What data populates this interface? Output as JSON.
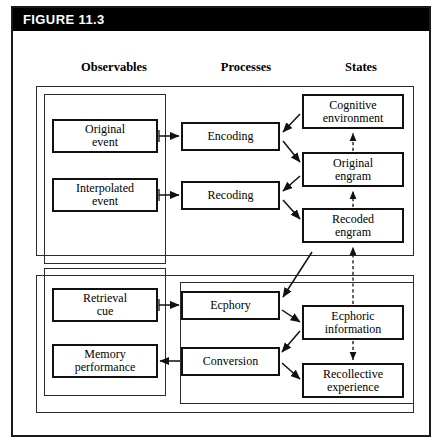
{
  "figure": {
    "header_label": "FIGURE 11.3",
    "width": 443,
    "height": 448,
    "background": "#ffffff",
    "header_background": "#000000",
    "header_text_color": "#ffffff",
    "line_color": "#111111"
  },
  "columns": [
    {
      "id": "observables",
      "label": "Observables"
    },
    {
      "id": "processes",
      "label": "Processes"
    },
    {
      "id": "states",
      "label": "States"
    }
  ],
  "nodes": {
    "original_event": {
      "label": "Original\nevent",
      "line1": "Original",
      "line2": "event",
      "column": "observables"
    },
    "interpolated_event": {
      "label": "Interpolated\nevent",
      "line1": "Interpolated",
      "line2": "event",
      "column": "observables"
    },
    "retrieval_cue": {
      "label": "Retrieval\ncue",
      "line1": "Retrieval",
      "line2": "cue",
      "column": "observables"
    },
    "memory_performance": {
      "label": "Memory\nperformance",
      "line1": "Memory",
      "line2": "performance",
      "column": "observables"
    },
    "encoding": {
      "label": "Encoding",
      "line1": "Encoding",
      "line2": "",
      "column": "processes"
    },
    "recoding": {
      "label": "Recoding",
      "line1": "Recoding",
      "line2": "",
      "column": "processes"
    },
    "ecphory": {
      "label": "Ecphory",
      "line1": "Ecphory",
      "line2": "",
      "column": "processes"
    },
    "conversion": {
      "label": "Conversion",
      "line1": "Conversion",
      "line2": "",
      "column": "processes"
    },
    "cognitive_environment": {
      "label": "Cognitive\nenvironment",
      "line1": "Cognitive",
      "line2": "environment",
      "column": "states"
    },
    "original_engram": {
      "label": "Original\nengram",
      "line1": "Original",
      "line2": "engram",
      "column": "states"
    },
    "recoded_engram": {
      "label": "Recoded\nengram",
      "line1": "Recoded",
      "line2": "engram",
      "column": "states"
    },
    "ecphoric_information": {
      "label": "Ecphoric\ninformation",
      "line1": "Ecphoric",
      "line2": "information",
      "column": "states"
    },
    "recollective_experience": {
      "label": "Recollective\nexperience",
      "line1": "Recollective",
      "line2": "experience",
      "column": "states"
    }
  },
  "edges": [
    {
      "from": "original_event",
      "to": "encoding",
      "style": "solid",
      "direction": "right"
    },
    {
      "from": "interpolated_event",
      "to": "recoding",
      "style": "solid",
      "direction": "right"
    },
    {
      "from": "retrieval_cue",
      "to": "ecphory",
      "style": "solid",
      "direction": "right"
    },
    {
      "from": "conversion",
      "to": "memory_performance",
      "style": "solid",
      "direction": "left"
    },
    {
      "from": "cognitive_environment",
      "to": "encoding",
      "style": "solid",
      "direction": "diagonal-down-left"
    },
    {
      "from": "encoding",
      "to": "original_engram",
      "style": "solid",
      "direction": "diagonal-down-right"
    },
    {
      "from": "original_engram",
      "to": "recoding",
      "style": "solid",
      "direction": "diagonal-down-left"
    },
    {
      "from": "recoding",
      "to": "recoded_engram",
      "style": "solid",
      "direction": "diagonal-down-right"
    },
    {
      "from": "recoded_engram",
      "to": "ecphory",
      "style": "solid",
      "direction": "diagonal-down-left"
    },
    {
      "from": "ecphory",
      "to": "ecphoric_information",
      "style": "solid",
      "direction": "diagonal-down-right"
    },
    {
      "from": "ecphoric_information",
      "to": "conversion",
      "style": "solid",
      "direction": "diagonal-down-left"
    },
    {
      "from": "conversion",
      "to": "recollective_experience",
      "style": "solid",
      "direction": "diagonal-down-right"
    },
    {
      "from": "original_engram",
      "to": "cognitive_environment",
      "style": "dashed",
      "direction": "up"
    },
    {
      "from": "recoded_engram",
      "to": "original_engram",
      "style": "dashed",
      "direction": "up"
    },
    {
      "from": "ecphoric_information",
      "to": "recoded_engram",
      "style": "dashed",
      "direction": "up"
    },
    {
      "from": "ecphoric_information",
      "to": "recollective_experience",
      "style": "dashed",
      "direction": "down"
    }
  ]
}
